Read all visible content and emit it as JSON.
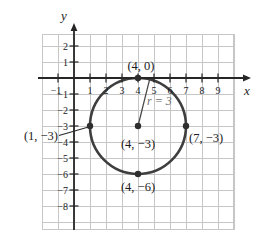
{
  "figure": {
    "background": "#ffffff",
    "grid_color": "#c6c6c6",
    "axis_color": "#262626",
    "curve_color": "#3e3e3e",
    "point_color": "#2e2e2e",
    "text_color": "#1b1b1b",
    "radius_label_color": "#707070"
  },
  "chart_data": {
    "type": "scatter",
    "xlabel": "x",
    "ylabel": "y",
    "xlim": [
      -2,
      10
    ],
    "ylim": [
      -9.5,
      2.75
    ],
    "grid": true,
    "x_ticks": [
      -1,
      1,
      2,
      3,
      4,
      5,
      6,
      7,
      8,
      9
    ],
    "y_ticks": [
      2,
      1,
      -1,
      -2,
      -3,
      -4,
      -5,
      -6,
      -7,
      -8
    ],
    "circle": {
      "center": [
        4,
        -3
      ],
      "radius": 3
    },
    "points": [
      {
        "xy": [
          4,
          0
        ],
        "label": "(4, 0)"
      },
      {
        "xy": [
          1,
          -3
        ],
        "label": "(1, −3)"
      },
      {
        "xy": [
          7,
          -3
        ],
        "label": "(7, −3)"
      },
      {
        "xy": [
          4,
          -3
        ],
        "label": "(4, −3)"
      },
      {
        "xy": [
          4,
          -6
        ],
        "label": "(4, −6)"
      }
    ],
    "radius_segment": {
      "from": [
        4,
        -3
      ],
      "angle_deg": 76,
      "label": "r = 3"
    }
  }
}
